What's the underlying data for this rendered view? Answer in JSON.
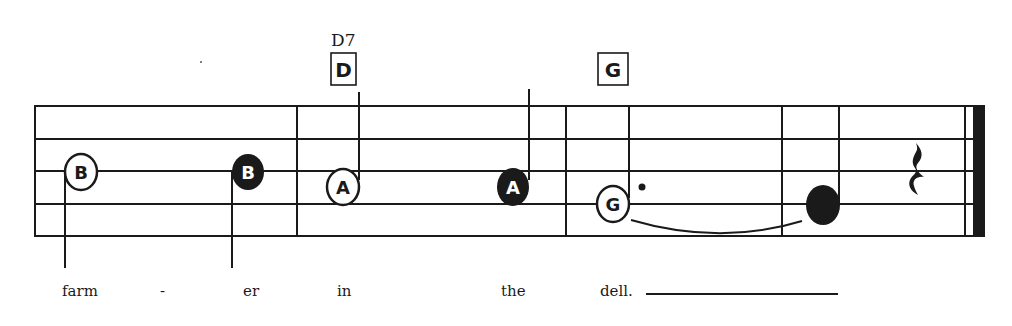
{
  "chords": [
    {
      "name": "D7",
      "box_letter": "D"
    },
    {
      "name": "",
      "box_letter": "G"
    }
  ],
  "notes": [
    {
      "letter": "B",
      "style": "hollow-circle",
      "stem": "down"
    },
    {
      "letter": "B",
      "style": "filled-circle",
      "stem": "down"
    },
    {
      "letter": "A",
      "style": "hollow-circle",
      "stem": "up"
    },
    {
      "letter": "A",
      "style": "filled-circle",
      "stem": "up"
    },
    {
      "letter": "G",
      "style": "hollow-circle-dotted",
      "stem": "up"
    },
    {
      "letter": "",
      "style": "filled-blank",
      "stem": "up"
    }
  ],
  "lyrics": [
    "farm",
    "-",
    "er",
    "in",
    "the",
    "dell."
  ],
  "rest": "quarter-rest",
  "colors": {
    "ink": "#1a1a1a",
    "paper": "#ffffff"
  }
}
